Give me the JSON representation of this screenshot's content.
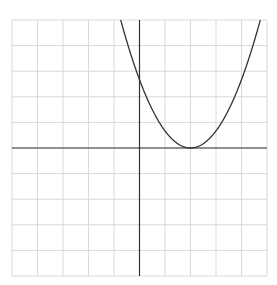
{
  "chart_data": {
    "type": "line",
    "title": "",
    "xlabel": "",
    "ylabel": "",
    "xlim": [
      -5,
      5
    ],
    "ylim": [
      -5,
      5
    ],
    "grid": true,
    "grid_step": 1,
    "series": [
      {
        "name": "parabola",
        "equation": "y = (2/3)(x - 2)^2",
        "vertex": [
          2,
          0
        ],
        "y_intercept": 2.67,
        "x": [
          -0.74,
          0,
          1,
          2,
          3,
          4,
          4.74
        ],
        "values": [
          5,
          2.67,
          0.67,
          0,
          0.67,
          2.67,
          5
        ]
      }
    ]
  },
  "colors": {
    "grid": "#d9d9d9",
    "axis": "#333333",
    "curve": "#333333",
    "background": "#ffffff"
  }
}
